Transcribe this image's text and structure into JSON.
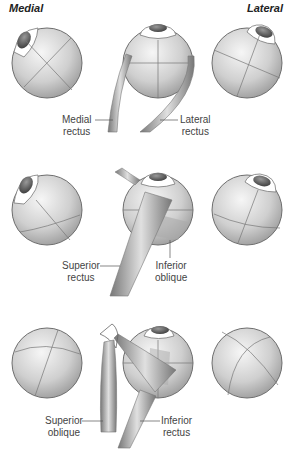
{
  "headers": {
    "medial": "Medial",
    "lateral": "Lateral"
  },
  "rows": [
    {
      "muscles": [
        {
          "name_line1": "Medial",
          "name_line2": "rectus"
        },
        {
          "name_line1": "Lateral",
          "name_line2": "rectus"
        }
      ]
    },
    {
      "muscles": [
        {
          "name_line1": "Superior",
          "name_line2": "rectus"
        },
        {
          "name_line1": "Inferior",
          "name_line2": "oblique"
        }
      ]
    },
    {
      "muscles": [
        {
          "name_line1": "Superior",
          "name_line2": "oblique"
        },
        {
          "name_line1": "Inferior",
          "name_line2": "rectus"
        }
      ]
    }
  ],
  "colors": {
    "eyeball_light": "#f4f4f4",
    "eyeball_dark": "#9a9a9a",
    "outline": "#6e6e6e",
    "pupil": "#555555",
    "muscle": "#8a8a8a"
  }
}
